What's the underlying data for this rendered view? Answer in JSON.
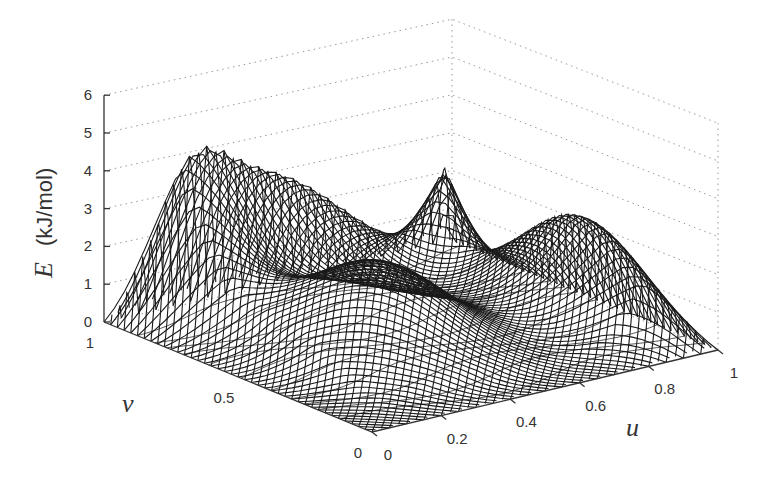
{
  "chart_data": {
    "type": "surface3d",
    "title": "",
    "zlabel": {
      "var": "E",
      "unit": "(kJ/mol)"
    },
    "xlabel": "u",
    "ylabel": "v",
    "zlim": [
      0,
      6
    ],
    "xlim": [
      0,
      1
    ],
    "ylim": [
      0,
      1
    ],
    "z_ticks": [
      "0",
      "1",
      "2",
      "3",
      "4",
      "5",
      "6"
    ],
    "u_ticks": [
      "0",
      "0.2",
      "0.4",
      "0.6",
      "0.8",
      "1"
    ],
    "v_ticks": [
      "0",
      "0.5",
      "1"
    ],
    "grid": true,
    "grid_style": "dotted",
    "mesh_style": "black wireframe (diagonal crosshatch)",
    "floor_contours": true,
    "features": [
      {
        "description": "corner peak near u=1, v=1 (back)",
        "z": 5.8
      },
      {
        "description": "ridge along v=1 edge at u~0.3",
        "z": 5.9
      },
      {
        "description": "ridge along u=1 edge at v~0.3",
        "z": 5.0
      },
      {
        "description": "minimum basin at u=0, v=0 (front)",
        "z": 0.0
      },
      {
        "description": "saddle region center",
        "z": 2.0
      }
    ]
  },
  "axes": {
    "z_label_var": "E",
    "z_label_unit": "(kJ/mol)",
    "u_label": "u",
    "v_label": "v"
  }
}
